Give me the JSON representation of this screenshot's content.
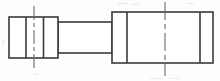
{
  "drawing": {
    "title": "Stepped shaft elevation view",
    "type": "technical-line-drawing",
    "canvas": {
      "width": 220,
      "height": 81
    },
    "stroke_color": "#3a3a3a",
    "centerline_color": "#6b6b6b",
    "fill_color": "#ffffff",
    "background_color": "#fdfdfc",
    "shapes": {
      "left_flange": {
        "name": "left-flange-block",
        "x": 9,
        "y": 17,
        "width": 49,
        "height": 41,
        "dividers_x": [
          26,
          43.5
        ]
      },
      "shaft": {
        "name": "shaft-section",
        "x": 58,
        "y": 22,
        "width": 54,
        "height": 31
      },
      "right_flange": {
        "name": "right-flange-block",
        "x": 112,
        "y": 12,
        "width": 101,
        "height": 51,
        "dividers_x": [
          127,
          200
        ]
      }
    },
    "centerlines": [
      {
        "name": "left-centerline",
        "x": 34,
        "y_start": 6,
        "y_end": 70,
        "dash_pattern": "14 3 4 3"
      },
      {
        "name": "right-centerline",
        "x": 165,
        "y_start": 2,
        "y_end": 76,
        "dash_pattern": "18 4 5 4"
      }
    ]
  }
}
